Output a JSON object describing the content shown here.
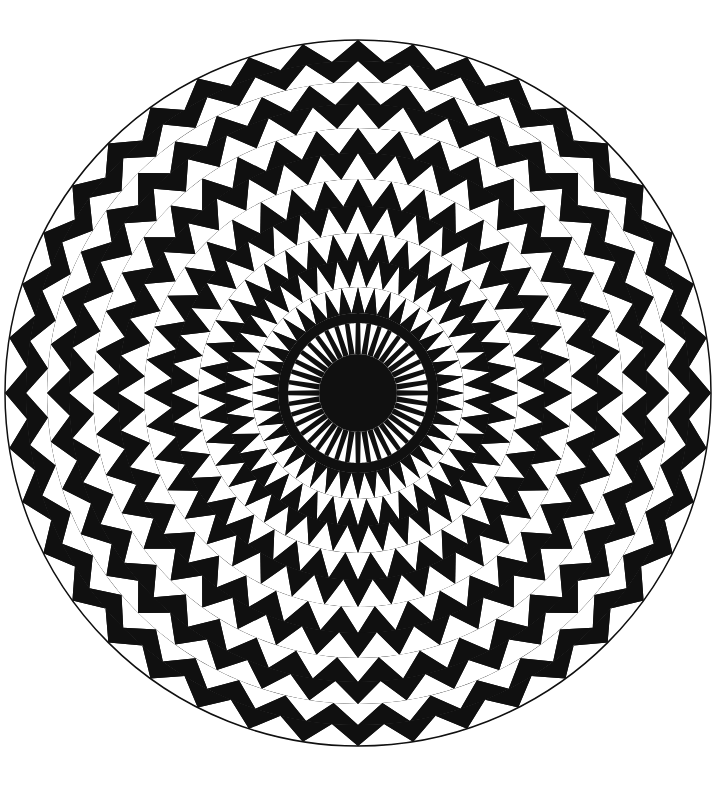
{
  "canvas": {
    "width": 725,
    "height": 799,
    "background_color": "#ffffff"
  },
  "artwork": {
    "title": "Radial Triangle Mandala",
    "description": "Black and white concentric radial mandala of alternating triangles within a circle",
    "ink_color": "#101010",
    "paper_color": "#ffffff"
  },
  "chart_data": {
    "type": "pie",
    "xlabel": "",
    "ylabel": "",
    "legend_position": "none",
    "grid": false,
    "geometry": {
      "center_x": 358,
      "center_y": 393,
      "outer_radius": 353,
      "inner_disk_radius": 39,
      "spoke_count": 40,
      "ring_count": 13
    },
    "colors": {
      "fill_dark": "#101010",
      "fill_light": "#ffffff",
      "outline": "#101010"
    },
    "rings": [
      {
        "index": 0,
        "r_inner": 39,
        "r_outer": 70,
        "kind": "spikes",
        "sectors": 40,
        "note": "white tapered rays on black field"
      },
      {
        "index": 1,
        "r_inner": 70,
        "r_outer": 80,
        "kind": "band",
        "sectors": 0,
        "note": "solid black band"
      },
      {
        "index": 2,
        "r_inner": 80,
        "r_outer": 106,
        "kind": "triangles",
        "sectors": 40,
        "note": "white outward triangles on black"
      },
      {
        "index": 3,
        "r_inner": 106,
        "r_outer": 133,
        "kind": "triangles",
        "sectors": 40,
        "note": "black inward triangles on white"
      },
      {
        "index": 4,
        "r_inner": 133,
        "r_outer": 160,
        "kind": "triangles",
        "sectors": 40,
        "note": "alternating lattice"
      },
      {
        "index": 5,
        "r_inner": 160,
        "r_outer": 187,
        "kind": "triangles",
        "sectors": 40,
        "note": "alternating lattice"
      },
      {
        "index": 6,
        "r_inner": 187,
        "r_outer": 214,
        "kind": "triangles",
        "sectors": 40,
        "note": "alternating lattice"
      },
      {
        "index": 7,
        "r_inner": 214,
        "r_outer": 240,
        "kind": "triangles",
        "sectors": 40,
        "note": "alternating lattice"
      },
      {
        "index": 8,
        "r_inner": 240,
        "r_outer": 265,
        "kind": "triangles",
        "sectors": 40,
        "note": "alternating lattice"
      },
      {
        "index": 9,
        "r_inner": 265,
        "r_outer": 289,
        "kind": "triangles",
        "sectors": 40,
        "note": "alternating lattice"
      },
      {
        "index": 10,
        "r_inner": 289,
        "r_outer": 311,
        "kind": "triangles",
        "sectors": 40,
        "note": "alternating lattice"
      },
      {
        "index": 11,
        "r_inner": 311,
        "r_outer": 332,
        "kind": "triangles",
        "sectors": 40,
        "note": "alternating lattice"
      },
      {
        "index": 12,
        "r_inner": 332,
        "r_outer": 353,
        "kind": "triangles",
        "sectors": 40,
        "note": "compressed outer rim lattice"
      }
    ]
  }
}
